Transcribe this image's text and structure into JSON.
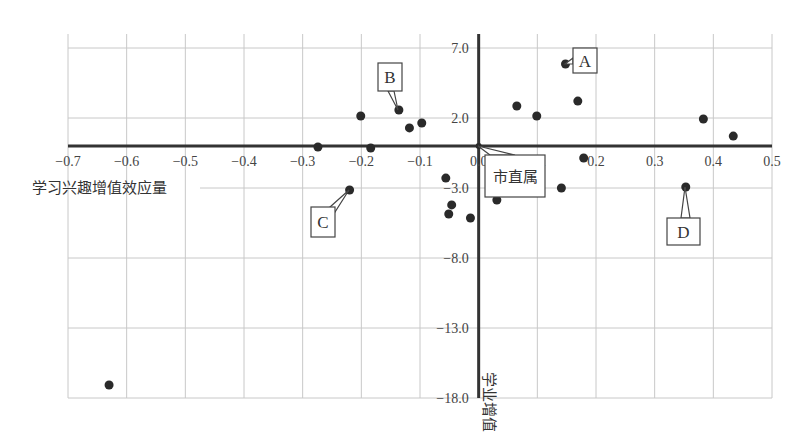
{
  "chart_data": {
    "type": "scatter",
    "title": "",
    "xlabel": "学习兴趣增值效应量",
    "ylabel": "学业增值",
    "xlim": [
      -0.7,
      0.5
    ],
    "ylim": [
      -18.0,
      7.0
    ],
    "grid": true,
    "legend": null,
    "x_ticks": [
      "-0.7",
      "-0.6",
      "-0.5",
      "-0.4",
      "-0.3",
      "-0.2",
      "-0.1",
      "0.0",
      "0.1",
      "0.2",
      "0.3",
      "0.4",
      "0.5"
    ],
    "y_ticks": [
      "7.0",
      "2.0",
      "-3.0",
      "-8.0",
      "-13.0",
      "-18.0"
    ],
    "points": [
      {
        "x": 0.148,
        "y": 5.86,
        "label": "A"
      },
      {
        "x": 0.169,
        "y": 3.21,
        "label": ""
      },
      {
        "x": 0.065,
        "y": 2.86,
        "label": ""
      },
      {
        "x": 0.099,
        "y": 2.14,
        "label": ""
      },
      {
        "x": 0.179,
        "y": -0.86,
        "label": ""
      },
      {
        "x": 0.141,
        "y": -3.0,
        "label": ""
      },
      {
        "x": 0.353,
        "y": -2.93,
        "label": "D"
      },
      {
        "x": 0.383,
        "y": 1.93,
        "label": ""
      },
      {
        "x": 0.434,
        "y": 0.71,
        "label": ""
      },
      {
        "x": -0.136,
        "y": 2.57,
        "label": "B"
      },
      {
        "x": -0.201,
        "y": 2.14,
        "label": ""
      },
      {
        "x": -0.118,
        "y": 1.29,
        "label": ""
      },
      {
        "x": -0.097,
        "y": 1.64,
        "label": ""
      },
      {
        "x": -0.184,
        "y": -0.14,
        "label": ""
      },
      {
        "x": -0.274,
        "y": -0.07,
        "label": ""
      },
      {
        "x": -0.22,
        "y": -3.14,
        "label": "C"
      },
      {
        "x": -0.056,
        "y": -2.29,
        "label": ""
      },
      {
        "x": -0.046,
        "y": -4.21,
        "label": ""
      },
      {
        "x": -0.051,
        "y": -4.86,
        "label": ""
      },
      {
        "x": -0.014,
        "y": -5.14,
        "label": ""
      },
      {
        "x": 0.031,
        "y": -3.86,
        "label": ""
      },
      {
        "x": 0.0,
        "y": 0.0,
        "label": "市直属"
      },
      {
        "x": -0.63,
        "y": -17.07,
        "label": ""
      }
    ],
    "callouts": [
      {
        "text": "A",
        "box": [
          573,
          48,
          24,
          25
        ],
        "anchor": [
          565,
          64
        ],
        "tail": [
          [
            573,
            58
          ],
          [
            573,
            64
          ]
        ]
      },
      {
        "text": "B",
        "box": [
          378,
          63,
          24,
          28
        ],
        "anchor": [
          398,
          110
        ],
        "tail": [
          [
            388,
            91
          ],
          [
            394,
            91
          ]
        ]
      },
      {
        "text": "C",
        "box": [
          311,
          207,
          24,
          30
        ],
        "anchor": [
          349,
          190
        ],
        "tail": [
          [
            330,
            207
          ],
          [
            335,
            212
          ]
        ]
      },
      {
        "text": "D",
        "box": [
          667,
          218,
          33,
          27
        ],
        "anchor": [
          685,
          187
        ],
        "tail": [
          [
            681,
            218
          ],
          [
            690,
            218
          ]
        ]
      },
      {
        "text": "市直属",
        "box": [
          485,
          155,
          60,
          42
        ],
        "anchor": [
          478,
          146
        ],
        "tail": [
          [
            490,
            155
          ],
          [
            515,
            155
          ]
        ]
      }
    ]
  },
  "colors": {
    "axis": "#333333",
    "grid": "#c8c8c8",
    "point": "#2a2a2a",
    "callout_border": "#444444"
  }
}
